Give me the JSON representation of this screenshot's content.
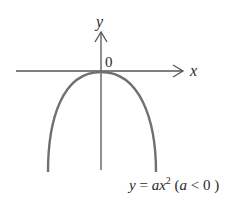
{
  "diagram": {
    "axes": {
      "x_label": "x",
      "y_label": "y",
      "origin_label": "0"
    },
    "curve": {
      "type": "parabola",
      "vertex": [
        0,
        0
      ],
      "opens": "down",
      "color": "#707070"
    },
    "equation": {
      "lhs": "y",
      "eq": " = ",
      "coef": "a",
      "var": "x",
      "exp": "2",
      "cond_open": " (",
      "cond_var": "a",
      "cond_rel": " < 0",
      "cond_close": " )"
    },
    "colors": {
      "axis": "#555555",
      "curve": "#707070",
      "text": "#2a2a2a"
    }
  }
}
